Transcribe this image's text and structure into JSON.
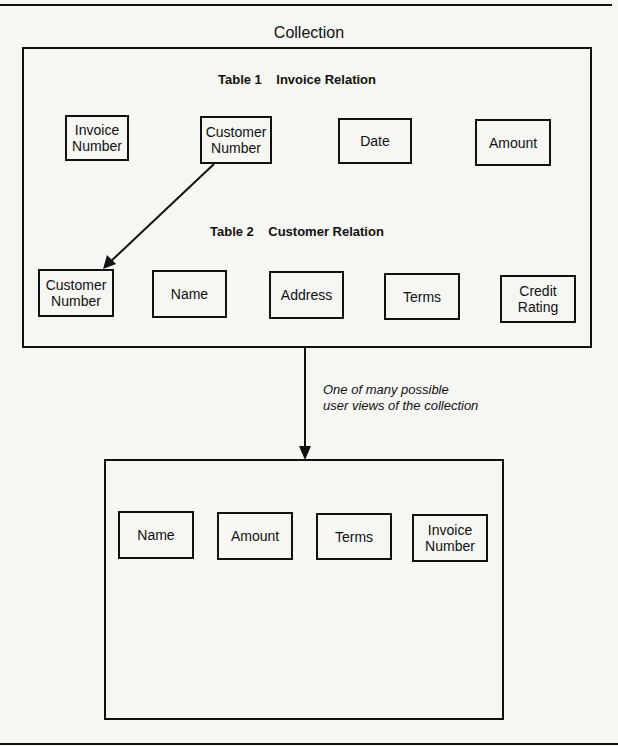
{
  "title": "Collection",
  "collection": {
    "table1": {
      "caption": "Table 1    Invoice Relation",
      "fields": [
        {
          "label": "Invoice\nNumber"
        },
        {
          "label": "Customer\nNumber"
        },
        {
          "label": "Date"
        },
        {
          "label": "Amount"
        }
      ]
    },
    "table2": {
      "caption": "Table 2    Customer Relation",
      "fields": [
        {
          "label": "Customer\nNumber"
        },
        {
          "label": "Name"
        },
        {
          "label": "Address"
        },
        {
          "label": "Terms"
        },
        {
          "label": "Credit\nRating"
        }
      ]
    },
    "link": {
      "from": "Table 1 Customer Number",
      "to": "Table 2 Customer Number"
    }
  },
  "view_arrow": {
    "annotation_line1": "One of many possible",
    "annotation_line2": "user views of the collection"
  },
  "user_view": {
    "fields": [
      {
        "label": "Name"
      },
      {
        "label": "Amount"
      },
      {
        "label": "Terms"
      },
      {
        "label": "Invoice\nNumber"
      }
    ]
  },
  "colors": {
    "ink": "#111111",
    "paper": "#f6f6f3"
  }
}
